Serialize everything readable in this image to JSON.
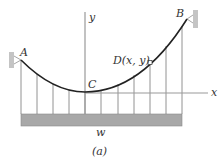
{
  "figure": {
    "caption": "(a)",
    "labels": {
      "point_a": "A",
      "point_b": "B",
      "point_c": "C",
      "point_d": "D(x, y)",
      "axis_x": "x",
      "axis_y": "y",
      "load": "w"
    },
    "colors": {
      "cable": "#222222",
      "hanger": "#777777",
      "axis": "#999999",
      "deck": "#a8a8a8",
      "support": "#c4c4c4"
    }
  }
}
